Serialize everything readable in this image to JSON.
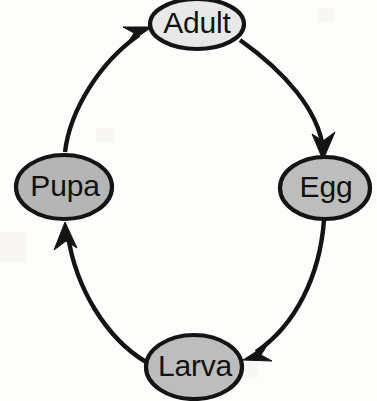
{
  "diagram": {
    "type": "cycle-diagram",
    "background_color": "#ffffff",
    "outline_color": "#141414",
    "label_color": "#111111",
    "nodes": [
      {
        "id": "adult",
        "label": "Adult",
        "icon": "ellipse-node-icon",
        "fill": "#e8e8e8",
        "cx": 197,
        "cy": 24,
        "rx": 47,
        "ry": 25
      },
      {
        "id": "egg",
        "label": "Egg",
        "icon": "ellipse-node-icon",
        "fill": "#bdbdbd",
        "cx": 325,
        "cy": 188,
        "rx": 45,
        "ry": 31
      },
      {
        "id": "larva",
        "label": "Larva",
        "icon": "ellipse-node-icon",
        "fill": "#bdbdbd",
        "cx": 194,
        "cy": 367,
        "rx": 48,
        "ry": 32
      },
      {
        "id": "pupa",
        "label": "Pupa",
        "icon": "ellipse-node-icon",
        "fill": "#b5b5b5",
        "cx": 64,
        "cy": 187,
        "rx": 48,
        "ry": 32
      }
    ],
    "edges": [
      {
        "id": "adult-to-egg",
        "from": "Adult",
        "to": "Egg",
        "icon": "curved-arrow-icon",
        "direction": "clockwise"
      },
      {
        "id": "egg-to-larva",
        "from": "Egg",
        "to": "Larva",
        "icon": "curved-arrow-icon",
        "direction": "clockwise"
      },
      {
        "id": "larva-to-pupa",
        "from": "Larva",
        "to": "Pupa",
        "icon": "curved-arrow-icon",
        "direction": "clockwise"
      },
      {
        "id": "pupa-to-adult",
        "from": "Pupa",
        "to": "Adult",
        "icon": "curved-arrow-icon",
        "direction": "clockwise"
      }
    ]
  }
}
